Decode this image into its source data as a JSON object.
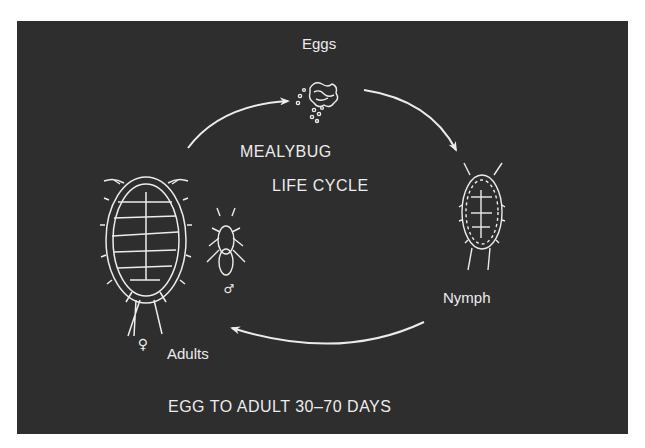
{
  "diagram": {
    "title_line1": "MEALYBUG",
    "title_line2": "LIFE CYCLE",
    "stages": [
      {
        "id": "eggs",
        "label": "Eggs"
      },
      {
        "id": "nymph",
        "label": "Nymph"
      },
      {
        "id": "adults",
        "label": "Adults",
        "symbols": {
          "female": "♀",
          "male": "♂"
        }
      }
    ],
    "footer": "EGG TO ADULT 30–70 DAYS",
    "colors": {
      "background": "#2e2e2e",
      "foreground": "#ececec",
      "page": "#ffffff"
    }
  }
}
